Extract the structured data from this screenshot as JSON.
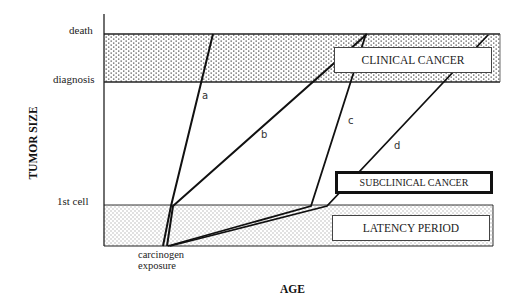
{
  "diagram": {
    "y_axis_label": "TUMOR SIZE",
    "x_axis_label": "AGE",
    "y_ticks": {
      "death": "death",
      "diagnosis": "diagnosis",
      "first_cell": "1st cell"
    },
    "origin_label_line1": "carcinogen",
    "origin_label_line2": "exposure",
    "regions": {
      "clinical": "CLINICAL CANCER",
      "subclinical": "SUBCLINICAL CANCER",
      "latency": "LATENCY PERIOD"
    },
    "trajectory_labels": [
      "a",
      "b",
      "c",
      "d"
    ],
    "colors": {
      "line": "#111111",
      "stipple_fill": "#bdbdbd",
      "background": "#ffffff"
    }
  }
}
